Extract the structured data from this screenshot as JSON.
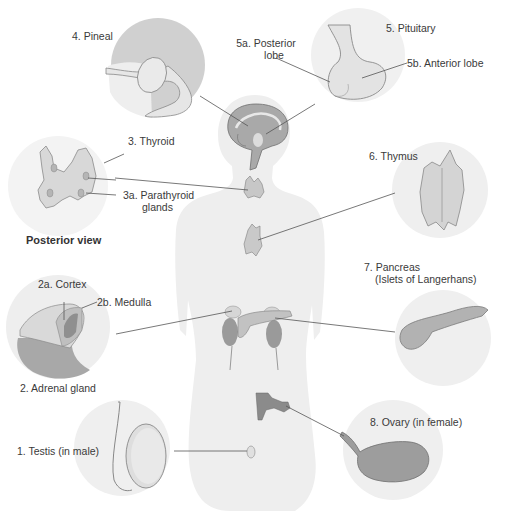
{
  "diagram": {
    "colors": {
      "background": "#ffffff",
      "body_silhouette": "#eeeeee",
      "inset_circle": "#ececec",
      "pineal_circle": "#c9c9c9",
      "gland_light": "#dcdcdc",
      "gland_mid": "#b8b8b8",
      "gland_dark": "#8f8f8f",
      "leader_line": "#555555",
      "text": "#3a3a3a"
    },
    "labels": {
      "pineal": "4. Pineal",
      "pituitary": "5. Pituitary",
      "posterior_lobe_1": "5a. Posterior",
      "posterior_lobe_2": "lobe",
      "anterior_lobe": "5b. Anterior lobe",
      "thyroid": "3. Thyroid",
      "parathyroid_1": "3a. Parathyroid",
      "parathyroid_2": "glands",
      "posterior_view": "Posterior view",
      "thymus": "6. Thymus",
      "pancreas_1": "7. Pancreas",
      "pancreas_2": "(Islets of Langerhans)",
      "cortex": "2a. Cortex",
      "medulla": "2b.  Medulla",
      "adrenal": "2. Adrenal gland",
      "testis": "1. Testis (in male)",
      "ovary": "8. Ovary (in female)"
    },
    "insets": [
      {
        "name": "pineal",
        "number": "4"
      },
      {
        "name": "pituitary",
        "number": "5"
      },
      {
        "name": "thyroid-posterior",
        "number": "3"
      },
      {
        "name": "thymus",
        "number": "6"
      },
      {
        "name": "adrenal",
        "number": "2"
      },
      {
        "name": "pancreas",
        "number": "7"
      },
      {
        "name": "testis",
        "number": "1"
      },
      {
        "name": "ovary",
        "number": "8"
      }
    ]
  }
}
